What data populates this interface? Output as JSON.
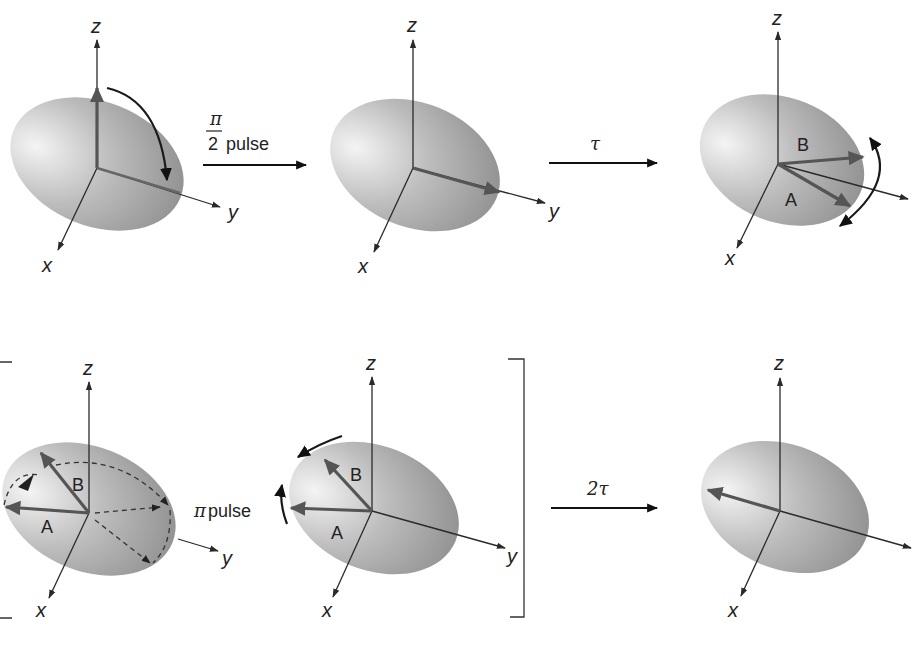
{
  "colors": {
    "sphere_light": "#f2f2f2",
    "sphere_dark": "#8e8e8e",
    "vector": "#555555",
    "axis": "#2a2a2a"
  },
  "axes": {
    "x": "x",
    "y": "y",
    "z": "z"
  },
  "panels": [
    {
      "id": 1,
      "row": 1,
      "description": "Magnetization along z, rotated toward y by pulse",
      "vectors": [],
      "rotation_arrow": "z-to-y"
    },
    {
      "id": 2,
      "row": 1,
      "description": "Magnetization along y",
      "vectors": []
    },
    {
      "id": 3,
      "row": 1,
      "description": "Dephasing in xy-plane",
      "vectors": [
        {
          "label": "B"
        },
        {
          "label": "A"
        }
      ],
      "rotation_arrow": "double"
    },
    {
      "id": 4,
      "row": 2,
      "description": "Pi pulse reflects vectors (dashed paths)",
      "vectors": [
        {
          "label": "B"
        },
        {
          "label": "A"
        }
      ]
    },
    {
      "id": 5,
      "row": 2,
      "description": "Vectors refocusing",
      "vectors": [
        {
          "label": "B"
        },
        {
          "label": "A"
        }
      ]
    },
    {
      "id": 6,
      "row": 2,
      "description": "Echo: vectors refocused along -y",
      "vectors": []
    }
  ],
  "steps": [
    {
      "id": "pulse-90",
      "numerator": "π",
      "denominator": "2",
      "suffix": "pulse"
    },
    {
      "id": "delay-tau",
      "label": "τ"
    },
    {
      "id": "pulse-180",
      "symbol": "π",
      "suffix": "pulse"
    },
    {
      "id": "delay-2tau",
      "label": "2τ"
    }
  ],
  "vector_labels": {
    "a": "A",
    "b": "B"
  }
}
